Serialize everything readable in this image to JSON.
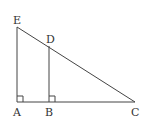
{
  "diagram": {
    "type": "geometry",
    "points": {
      "A": {
        "label": "A",
        "x": 17,
        "y": 102
      },
      "B": {
        "label": "B",
        "x": 49,
        "y": 102
      },
      "C": {
        "label": "C",
        "x": 135,
        "y": 102
      },
      "D": {
        "label": "D",
        "x": 49,
        "y": 46
      },
      "E": {
        "label": "E",
        "x": 17,
        "y": 27
      }
    },
    "segments": [
      "EA",
      "AC",
      "EC",
      "DB"
    ],
    "right_angles": [
      "A",
      "B"
    ],
    "colors": {
      "line": "#444444",
      "text": "#333333",
      "background": "#ffffff"
    }
  }
}
